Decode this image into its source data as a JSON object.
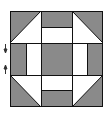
{
  "diagram": {
    "type": "quilt-block",
    "pattern": "churn-dash",
    "colors": {
      "dark": "#8a8a8a",
      "light": "#ffffff",
      "line": "#111111",
      "background": "#ffffff"
    },
    "markers": [
      {
        "name": "arrow-down-marker",
        "direction": "down"
      },
      {
        "name": "arrow-up-marker",
        "direction": "up"
      }
    ]
  }
}
